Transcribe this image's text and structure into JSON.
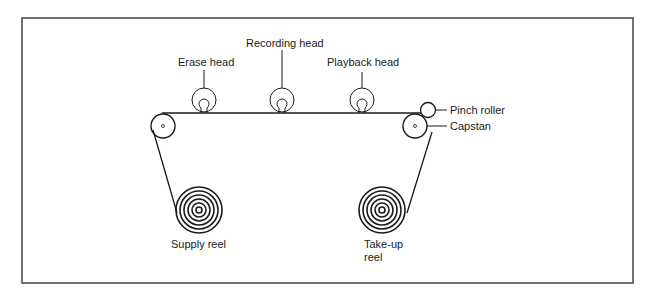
{
  "diagram": {
    "labels": {
      "erase_head": "Erase head",
      "recording_head": "Recording head",
      "playback_head": "Playback head",
      "pinch_roller": "Pinch roller",
      "capstan": "Capstan",
      "supply_reel": "Supply reel",
      "takeup_reel_line1": "Take-up",
      "takeup_reel_line2": "reel"
    },
    "colors": {
      "stroke": "#1a1a1a",
      "frame": "#444444",
      "background": "#ffffff"
    }
  }
}
